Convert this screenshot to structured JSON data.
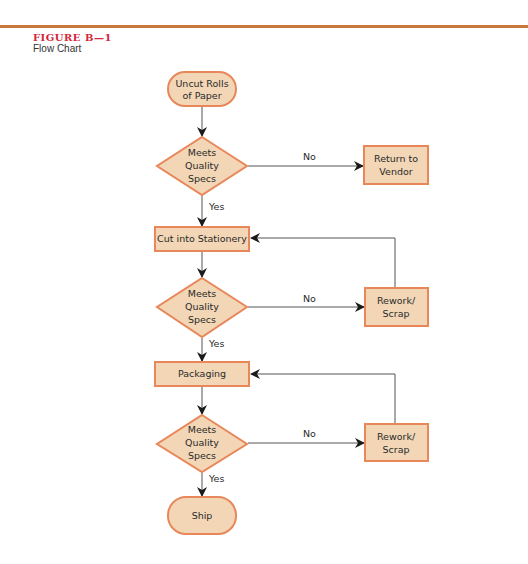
{
  "figure": {
    "label": "FIGURE B—1",
    "caption": "Flow Chart"
  },
  "colors": {
    "rule": "#c8783a",
    "figure_label": "#d4263a",
    "node_fill": "#f2d6b6",
    "node_stroke": "#e8875a",
    "edge": "#555555",
    "arrowhead": "#1a1a1a"
  },
  "nodes": {
    "start": {
      "type": "terminal",
      "lines": [
        "Uncut Rolls",
        "of Paper"
      ]
    },
    "decision1": {
      "type": "decision",
      "lines": [
        "Meets",
        "Quality",
        "Specs"
      ]
    },
    "return_vendor": {
      "type": "process",
      "lines": [
        "Return to",
        "Vendor"
      ]
    },
    "cut": {
      "type": "process",
      "lines": [
        "Cut into Stationery"
      ]
    },
    "decision2": {
      "type": "decision",
      "lines": [
        "Meets",
        "Quality",
        "Specs"
      ]
    },
    "rework1": {
      "type": "process",
      "lines": [
        "Rework/",
        "Scrap"
      ]
    },
    "packaging": {
      "type": "process",
      "lines": [
        "Packaging"
      ]
    },
    "decision3": {
      "type": "decision",
      "lines": [
        "Meets",
        "Quality",
        "Specs"
      ]
    },
    "rework2": {
      "type": "process",
      "lines": [
        "Rework/",
        "Scrap"
      ]
    },
    "ship": {
      "type": "terminal",
      "lines": [
        "Ship"
      ]
    }
  },
  "edges": [
    {
      "from": "start",
      "to": "decision1",
      "label": ""
    },
    {
      "from": "decision1",
      "to": "return_vendor",
      "label": "No"
    },
    {
      "from": "decision1",
      "to": "cut",
      "label": "Yes"
    },
    {
      "from": "cut",
      "to": "decision2",
      "label": ""
    },
    {
      "from": "decision2",
      "to": "rework1",
      "label": "No"
    },
    {
      "from": "rework1",
      "to": "cut",
      "label": ""
    },
    {
      "from": "decision2",
      "to": "packaging",
      "label": "Yes"
    },
    {
      "from": "packaging",
      "to": "decision3",
      "label": ""
    },
    {
      "from": "decision3",
      "to": "rework2",
      "label": "No"
    },
    {
      "from": "rework2",
      "to": "packaging",
      "label": ""
    },
    {
      "from": "decision3",
      "to": "ship",
      "label": "Yes"
    }
  ],
  "edge_labels": {
    "no1": "No",
    "yes1": "Yes",
    "no2": "No",
    "yes2": "Yes",
    "no3": "No",
    "yes3": "Yes"
  }
}
